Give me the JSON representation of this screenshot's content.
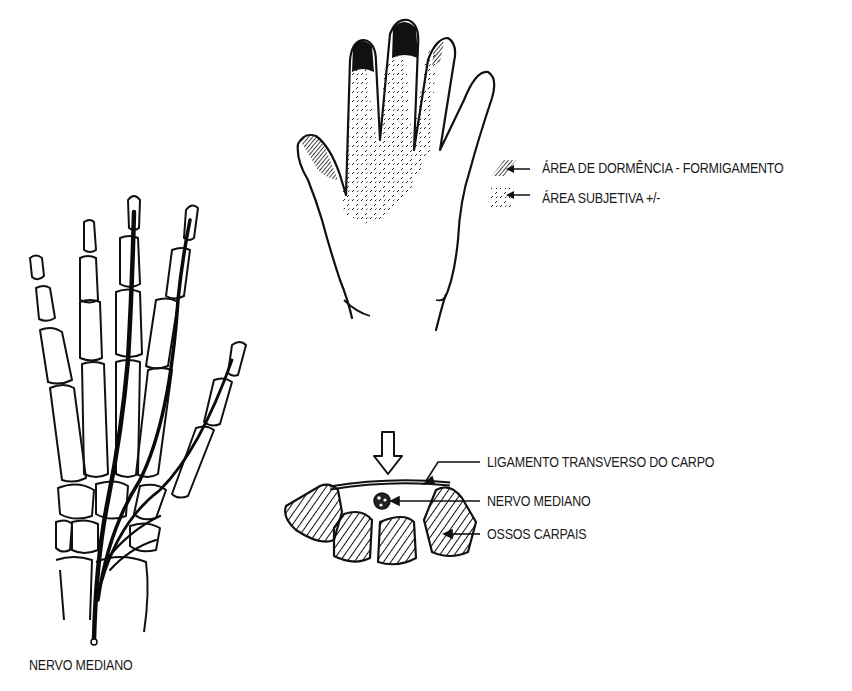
{
  "figure": {
    "topic": "Síndrome do túnel do carpo",
    "skeleton_panel": {
      "label": "NERVO MEDIANO"
    },
    "hand_panel": {
      "legend": [
        {
          "symbol": "dense-hatch",
          "label": "ÁREA DE DORMÊNCIA - FORMIGAMENTO"
        },
        {
          "symbol": "stipple",
          "label": "ÁREA SUBJETIVA +/-"
        }
      ]
    },
    "cross_section_panel": {
      "labels": [
        {
          "id": "ligament",
          "label": "LIGAMENTO TRANSVERSO DO CARPO"
        },
        {
          "id": "nerve",
          "label": "NERVO MEDIANO"
        },
        {
          "id": "bones",
          "label": "OSSOS CARPAIS"
        }
      ],
      "arrow": "pressure-arrow-down"
    }
  }
}
